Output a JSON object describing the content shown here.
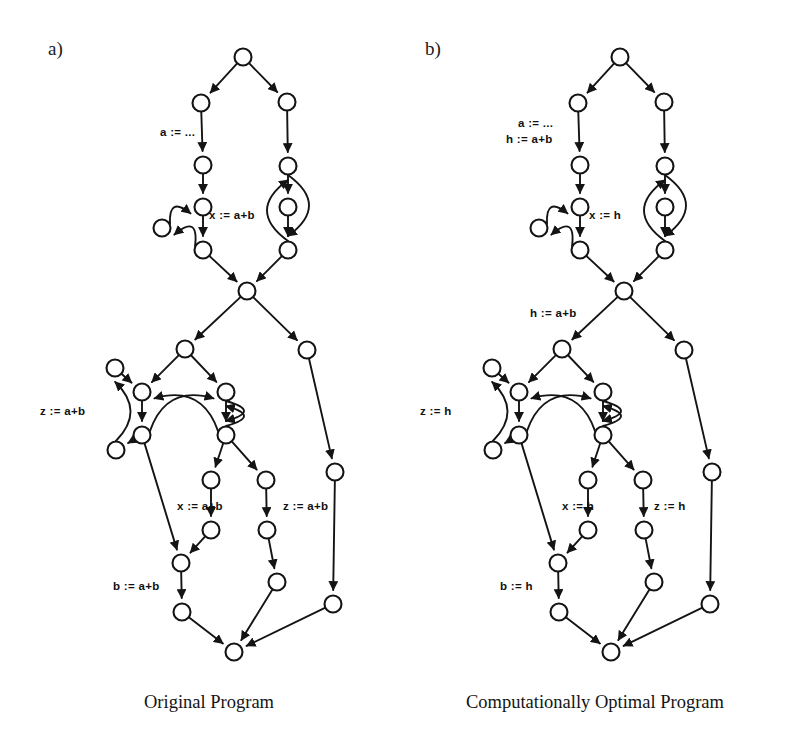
{
  "figure": {
    "width": 799,
    "height": 754,
    "background": "#ffffff",
    "ink_color": "#141414",
    "node_radius": 8.5
  },
  "panels": [
    {
      "id": "a",
      "tag": "a)",
      "tag_pos": {
        "x": 48,
        "y": 38
      },
      "caption": "Original Program",
      "caption_pos": {
        "x": 144,
        "y": 692
      },
      "origin_x": 0,
      "labels": [
        {
          "name": "label-a-assign",
          "text": "a := ...",
          "x": 160,
          "y": 126
        },
        {
          "name": "label-x-assign",
          "text": "x := a+b",
          "x": 209,
          "y": 209
        },
        {
          "name": "label-z-assign",
          "text": "z := a+b",
          "x": 40,
          "y": 405
        },
        {
          "name": "label-x-assign-2",
          "text": "x := a+b",
          "x": 177,
          "y": 500
        },
        {
          "name": "label-z-assign-2",
          "text": "z := a+b",
          "x": 283,
          "y": 500
        },
        {
          "name": "label-b-assign",
          "text": "b := a+b",
          "x": 113,
          "y": 580
        }
      ]
    },
    {
      "id": "b",
      "tag": "b)",
      "tag_pos": {
        "x": 425,
        "y": 38
      },
      "caption": "Computationally Optimal Program",
      "caption_pos": {
        "x": 466,
        "y": 692
      },
      "origin_x": 377,
      "labels": [
        {
          "name": "label-a-assign",
          "text": "a := ...",
          "x": 518,
          "y": 117
        },
        {
          "name": "label-h-assign",
          "text": "h := a+b",
          "x": 506,
          "y": 133
        },
        {
          "name": "label-x-assign",
          "text": "x := h",
          "x": 589,
          "y": 209
        },
        {
          "name": "label-h-assign-2",
          "text": "h := a+b",
          "x": 530,
          "y": 307
        },
        {
          "name": "label-z-assign",
          "text": "z := h",
          "x": 420,
          "y": 405
        },
        {
          "name": "label-x-assign-2",
          "text": "x := h",
          "x": 562,
          "y": 500
        },
        {
          "name": "label-z-assign-2",
          "text": "z := h",
          "x": 654,
          "y": 500
        },
        {
          "name": "label-b-assign",
          "text": "b := h",
          "x": 500,
          "y": 580
        }
      ]
    }
  ],
  "graph": {
    "description": "Control flow graph node positions (panel a coordinates); panel b is the same topology shifted right.",
    "nodes": [
      {
        "id": "n1",
        "x": 243,
        "y": 57
      },
      {
        "id": "n2",
        "x": 201,
        "y": 103
      },
      {
        "id": "n3",
        "x": 287,
        "y": 102
      },
      {
        "id": "n4",
        "x": 203,
        "y": 165
      },
      {
        "id": "n5",
        "x": 288,
        "y": 166
      },
      {
        "id": "n6",
        "x": 203,
        "y": 207
      },
      {
        "id": "n7",
        "x": 288,
        "y": 207
      },
      {
        "id": "n8",
        "x": 162,
        "y": 228
      },
      {
        "id": "n9",
        "x": 203,
        "y": 250
      },
      {
        "id": "n10",
        "x": 288,
        "y": 250
      },
      {
        "id": "n11",
        "x": 247,
        "y": 291
      },
      {
        "id": "n12",
        "x": 185,
        "y": 349
      },
      {
        "id": "n13",
        "x": 307,
        "y": 350
      },
      {
        "id": "n14",
        "x": 115,
        "y": 368
      },
      {
        "id": "n15",
        "x": 142,
        "y": 392
      },
      {
        "id": "n16",
        "x": 226,
        "y": 392
      },
      {
        "id": "n17",
        "x": 142,
        "y": 435
      },
      {
        "id": "n18",
        "x": 226,
        "y": 435
      },
      {
        "id": "n19",
        "x": 116,
        "y": 450
      },
      {
        "id": "n20",
        "x": 335,
        "y": 472
      },
      {
        "id": "n21",
        "x": 211,
        "y": 480
      },
      {
        "id": "n22",
        "x": 266,
        "y": 480
      },
      {
        "id": "n23",
        "x": 211,
        "y": 530
      },
      {
        "id": "n24",
        "x": 267,
        "y": 530
      },
      {
        "id": "n25",
        "x": 181,
        "y": 563
      },
      {
        "id": "n26",
        "x": 277,
        "y": 582
      },
      {
        "id": "n27",
        "x": 182,
        "y": 612
      },
      {
        "id": "n28",
        "x": 333,
        "y": 604
      },
      {
        "id": "n29",
        "x": 234,
        "y": 652
      }
    ],
    "edges": [
      {
        "from": "n1",
        "to": "n2",
        "kind": "line"
      },
      {
        "from": "n1",
        "to": "n3",
        "kind": "line"
      },
      {
        "from": "n2",
        "to": "n4",
        "kind": "line"
      },
      {
        "from": "n3",
        "to": "n5",
        "kind": "line"
      },
      {
        "from": "n4",
        "to": "n6",
        "kind": "line"
      },
      {
        "from": "n5",
        "to": "n7",
        "kind": "line"
      },
      {
        "from": "n6",
        "to": "n9",
        "kind": "line"
      },
      {
        "from": "n7",
        "to": "n10",
        "kind": "line"
      },
      {
        "from": "n8",
        "to": "n6",
        "kind": "curve"
      },
      {
        "from": "n9",
        "to": "n8",
        "kind": "curve"
      },
      {
        "from": "n9",
        "to": "n11",
        "kind": "line"
      },
      {
        "from": "n10",
        "to": "n11",
        "kind": "line"
      },
      {
        "from": "n5",
        "to": "n10",
        "kind": "curve"
      },
      {
        "from": "n10",
        "to": "n5",
        "kind": "curve"
      },
      {
        "from": "n11",
        "to": "n12",
        "kind": "line"
      },
      {
        "from": "n11",
        "to": "n13",
        "kind": "line"
      },
      {
        "from": "n12",
        "to": "n15",
        "kind": "line"
      },
      {
        "from": "n12",
        "to": "n16",
        "kind": "line"
      },
      {
        "from": "n14",
        "to": "n15",
        "kind": "line"
      },
      {
        "from": "n15",
        "to": "n17",
        "kind": "line"
      },
      {
        "from": "n16",
        "to": "n18",
        "kind": "line"
      },
      {
        "from": "n17",
        "to": "n19",
        "kind": "line"
      },
      {
        "from": "n19",
        "to": "n14",
        "kind": "curve"
      },
      {
        "from": "n17",
        "to": "n16",
        "kind": "curve"
      },
      {
        "from": "n18",
        "to": "n15",
        "kind": "curve"
      },
      {
        "from": "n16",
        "to": "n18",
        "kind": "curve"
      },
      {
        "from": "n18",
        "to": "n16",
        "kind": "curve"
      },
      {
        "from": "n17",
        "to": "n25",
        "kind": "line"
      },
      {
        "from": "n18",
        "to": "n21",
        "kind": "line"
      },
      {
        "from": "n18",
        "to": "n22",
        "kind": "line"
      },
      {
        "from": "n21",
        "to": "n23",
        "kind": "line"
      },
      {
        "from": "n22",
        "to": "n24",
        "kind": "line"
      },
      {
        "from": "n23",
        "to": "n25",
        "kind": "line"
      },
      {
        "from": "n24",
        "to": "n26",
        "kind": "line"
      },
      {
        "from": "n25",
        "to": "n27",
        "kind": "line"
      },
      {
        "from": "n13",
        "to": "n20",
        "kind": "line"
      },
      {
        "from": "n20",
        "to": "n28",
        "kind": "line"
      },
      {
        "from": "n26",
        "to": "n29",
        "kind": "line"
      },
      {
        "from": "n27",
        "to": "n29",
        "kind": "line"
      },
      {
        "from": "n28",
        "to": "n29",
        "kind": "line"
      }
    ]
  }
}
